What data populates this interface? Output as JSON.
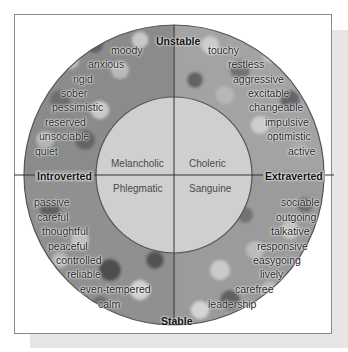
{
  "axes": {
    "top": "Unstable",
    "bottom": "Stable",
    "left": "Introverted",
    "right": "Extraverted"
  },
  "temperaments": {
    "top_left": "Melancholic",
    "top_right": "Choleric",
    "bottom_left": "Phlegmatic",
    "bottom_right": "Sanguine"
  },
  "traits": {
    "unstable_introverted": [
      "moody",
      "anxious",
      "rigid",
      "sober",
      "pessimistic",
      "reserved",
      "unsociable",
      "quiet"
    ],
    "unstable_extraverted": [
      "touchy",
      "restless",
      "aggressive",
      "excitable",
      "changeable",
      "impulsive",
      "optimistic",
      "active"
    ],
    "stable_introverted": [
      "passive",
      "careful",
      "thoughtful",
      "peaceful",
      "controlled",
      "reliable",
      "even-tempered",
      "calm"
    ],
    "stable_extraverted": [
      "sociable",
      "outgoing",
      "talkative",
      "responsive",
      "easygoing",
      "lively",
      "carefree",
      "leadership"
    ]
  },
  "colors": {
    "frame_border": "#8a8a8a",
    "shadow": "#e6e6e6",
    "inner_circle": "#cfcfcf",
    "outer_ring_photo": "#8e8e8e",
    "divider_lines": "#333333"
  }
}
